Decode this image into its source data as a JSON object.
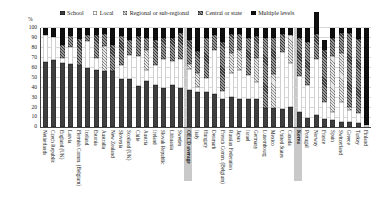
{
  "figure": {
    "ylabel_symbol": "%",
    "highlight_band_color": "#c9c9c9",
    "background": "#ffffff"
  },
  "chart_data": {
    "type": "bar",
    "stacked": true,
    "title": "",
    "xlabel": "",
    "ylabel": "%",
    "ylim": [
      0,
      100
    ],
    "ytick_step": 10,
    "grid": true,
    "legend_position": "top",
    "highlighted_categories": [
      "OECD average",
      "Korea"
    ],
    "series_styles": [
      {
        "name": "School",
        "color": "#3f3f3f",
        "pattern": "solid"
      },
      {
        "name": "Local",
        "color": "#ffffff",
        "pattern": "outline"
      },
      {
        "name": "Regional or sub-regional",
        "color": "#d9d9d9",
        "pattern": "light-hatch"
      },
      {
        "name": "Central or state",
        "color": "#6e6e6e",
        "pattern": "dark-hatch"
      },
      {
        "name": "Multiple levels",
        "color": "#0f0f0f",
        "pattern": "solid"
      }
    ],
    "categories": [
      "Netherlands",
      "Czech Republic",
      "England (UK)",
      "Latvia",
      "Flemish Comm. (Belgium)",
      "Iceland",
      "Estonia",
      "Australia",
      "New Zealand",
      "Slovenia",
      "Scotland (UK)",
      "Chile",
      "Austria",
      "Ireland",
      "Slovak Republic",
      "Lithuania",
      "Sweden",
      "OECD average",
      "Italy",
      "Hungary",
      "Denmark",
      "French Comm. (Belgium)",
      "Russian Federation",
      "Japan",
      "Israel",
      "Germany",
      "Luxembourg",
      "Mexico",
      "United States",
      "Canada",
      "Korea",
      "Portugal",
      "Norway",
      "France",
      "Spain",
      "Switzerland",
      "Greece",
      "Turkey",
      "Finland"
    ],
    "series": [
      {
        "name": "School",
        "values": [
          66,
          68,
          65,
          64,
          63,
          60,
          58,
          57,
          57,
          49,
          48,
          41,
          46,
          42,
          39,
          42,
          39,
          37,
          35,
          35,
          33,
          28,
          30,
          28,
          28,
          28,
          19,
          19,
          18,
          20,
          15,
          9,
          12,
          8,
          7,
          5,
          5,
          4,
          0
        ]
      },
      {
        "name": "Local",
        "values": [
          27,
          23,
          5,
          17,
          0,
          27,
          12,
          0,
          0,
          14,
          25,
          31,
          12,
          21,
          30,
          25,
          30,
          22,
          5,
          15,
          45,
          8,
          25,
          30,
          25,
          17,
          0,
          0,
          58,
          45,
          37,
          33,
          57,
          17,
          8,
          20,
          12,
          10,
          2
        ]
      },
      {
        "name": "Regional or sub-regional",
        "values": [
          0,
          0,
          0,
          0,
          0,
          0,
          0,
          25,
          0,
          0,
          0,
          0,
          20,
          0,
          0,
          0,
          0,
          5,
          15,
          0,
          0,
          0,
          20,
          20,
          0,
          25,
          0,
          35,
          0,
          28,
          0,
          0,
          0,
          0,
          57,
          50,
          3,
          0,
          0
        ]
      },
      {
        "name": "Central or state",
        "values": [
          0,
          0,
          13,
          11,
          26,
          6,
          23,
          12,
          26,
          29,
          15,
          20,
          12,
          25,
          21,
          23,
          26,
          24,
          22,
          40,
          15,
          50,
          19,
          16,
          37,
          22,
          71,
          36,
          18,
          0,
          38,
          44,
          25,
          53,
          18,
          20,
          75,
          75,
          0
        ]
      },
      {
        "name": "Multiple levels",
        "values": [
          7,
          9,
          17,
          8,
          11,
          7,
          7,
          6,
          17,
          8,
          12,
          8,
          10,
          12,
          10,
          10,
          5,
          12,
          23,
          10,
          7,
          14,
          6,
          6,
          10,
          8,
          10,
          10,
          6,
          7,
          10,
          14,
          22,
          10,
          10,
          5,
          5,
          11,
          98
        ]
      }
    ]
  }
}
